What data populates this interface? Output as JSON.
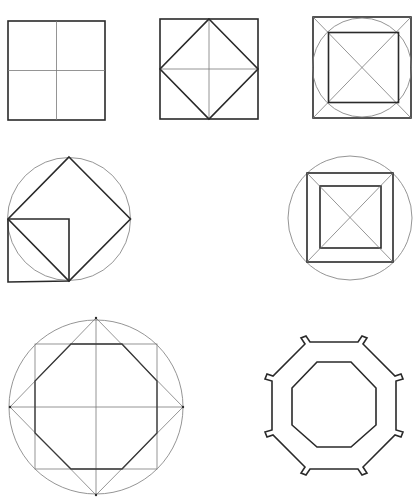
{
  "document": {
    "type": "geometric construction figures",
    "stroke_color": "#2a2a2a",
    "guide_color": "#7a7a7a",
    "background": "#ffffff"
  },
  "figures": [
    {
      "id": "square-quartered",
      "description": "Square divided into four quadrants by thin center lines"
    },
    {
      "id": "square-inscribed-diamond",
      "description": "Square with diamond connecting edge midpoints and thin center cross"
    },
    {
      "id": "square-circle-inner-square",
      "description": "Square with inscribed circle, diagonals, and inner square at circle-diagonal intersections"
    },
    {
      "id": "circle-diamond-small-square",
      "description": "Circle with inscribed diamond and small square sharing a side with the diamond"
    },
    {
      "id": "circle-double-square-frame",
      "description": "Circle with inscribed square frame (outer and inner squares) joined by diagonals"
    },
    {
      "id": "octagon-construction",
      "description": "Circle with diamond, square and center cross producing inscribed octagon"
    },
    {
      "id": "octagon-frame-with-tabs",
      "description": "Octagonal frame (outer and inner octagon) with small tabs at outer vertices"
    }
  ]
}
